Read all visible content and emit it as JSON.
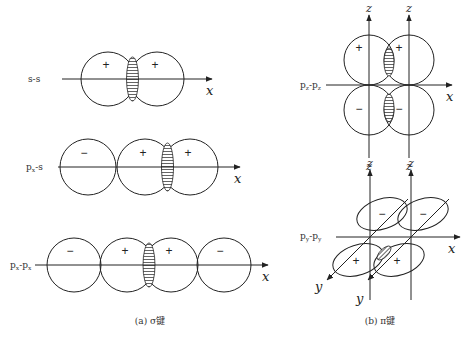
{
  "sigma": {
    "caption": "(a) σ键",
    "axis_label": "x",
    "rows": [
      {
        "label": "s-s",
        "axis_y": 79,
        "axis_x1": 62,
        "axis_x2": 212,
        "label_x": 28,
        "radius": 27,
        "orbitals": [
          {
            "cx": 108,
            "sign": "+"
          },
          {
            "cx": 157,
            "sign": "+"
          }
        ],
        "overlap": {
          "cx": 132.5,
          "rx": 6,
          "ry": 22
        }
      },
      {
        "label": "px-s",
        "label_main": "p",
        "label_sub": "x",
        "label_rest": "-s",
        "axis_y": 167,
        "axis_x1": 58,
        "axis_x2": 240,
        "label_x": 26,
        "radius": 28,
        "orbitals": [
          {
            "cx": 88,
            "sign": "−"
          },
          {
            "cx": 145,
            "sign": "+"
          },
          {
            "cx": 190,
            "sign": "+"
          }
        ],
        "overlap": {
          "cx": 167.5,
          "rx": 6,
          "ry": 24
        }
      },
      {
        "label": "px-px",
        "label_main": "p",
        "label_sub": "x",
        "label_rest": "-p",
        "label_sub2": "x",
        "axis_y": 265,
        "axis_x1": 35,
        "axis_x2": 268,
        "label_x": 10,
        "radius": 27,
        "orbitals": [
          {
            "cx": 74,
            "sign": "−"
          },
          {
            "cx": 127,
            "sign": "+"
          },
          {
            "cx": 171,
            "sign": "+"
          },
          {
            "cx": 224,
            "sign": "−"
          }
        ],
        "overlap": {
          "cx": 149,
          "rx": 6,
          "ry": 22
        }
      }
    ]
  },
  "pi": {
    "caption": "(b) π键",
    "pz": {
      "label": "pz-pz",
      "label_main": "p",
      "label_sub": "z",
      "label_rest": "-p",
      "label_sub2": "z",
      "axis_label_x": "x",
      "axis_label_z": "z",
      "z_axes": [
        369,
        409
      ],
      "axis_y": 85,
      "radius": 25,
      "upper_signs": [
        "+",
        "+"
      ],
      "lower_signs": [
        "−",
        "−"
      ]
    },
    "py": {
      "label": "py-py",
      "label_main": "p",
      "label_sub": "y",
      "label_rest": "-p",
      "label_sub2": "y",
      "axis_label_x": "x",
      "axis_label_y": "y",
      "axis_label_z": "z",
      "origins": [
        370,
        411
      ],
      "axis_y": 237,
      "back_signs": [
        "−",
        "−"
      ],
      "front_signs": [
        "+",
        "+"
      ]
    }
  }
}
